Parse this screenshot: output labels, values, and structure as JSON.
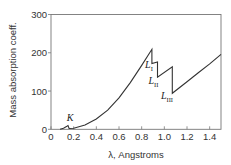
{
  "chart_data": {
    "type": "line",
    "title": "",
    "xlabel": "λ, Angstroms",
    "ylabel": "Mass absorption coeff.",
    "xlim": [
      0,
      1.5
    ],
    "ylim": [
      0,
      300
    ],
    "grid": false,
    "legend": null,
    "xticks": [
      0,
      0.2,
      0.4,
      0.6,
      0.8,
      1.0,
      1.2,
      1.4
    ],
    "xtick_labels": [
      "0",
      "0.2",
      "0.4",
      "0.6",
      "0.8",
      "1.0",
      "1.2",
      "1.4"
    ],
    "yticks": [
      0,
      100,
      200,
      300
    ],
    "ytick_labels": [
      "0",
      "100",
      "200",
      "300"
    ],
    "series": [
      {
        "name": "Mass absorption coefficient",
        "x": [
          0.08,
          0.11,
          0.14,
          0.15,
          0.16,
          0.2,
          0.3,
          0.4,
          0.5,
          0.6,
          0.7,
          0.8,
          0.89,
          0.89,
          0.94,
          0.94,
          1.07,
          1.07,
          1.2,
          1.3,
          1.4,
          1.5
        ],
        "values": [
          0,
          3,
          8,
          10,
          2,
          3,
          11,
          27,
          50,
          82,
          122,
          167,
          209,
          172,
          176,
          136,
          163,
          94,
          124,
          148,
          171,
          196
        ]
      }
    ],
    "annotations": [
      {
        "text": "K",
        "sub": "",
        "x": 0.14,
        "y": 22
      },
      {
        "text": "L",
        "sub": "I",
        "x": 0.83,
        "y": 160
      },
      {
        "text": "L",
        "sub": "II",
        "x": 0.86,
        "y": 118
      },
      {
        "text": "L",
        "sub": "III",
        "x": 0.97,
        "y": 78
      }
    ]
  }
}
